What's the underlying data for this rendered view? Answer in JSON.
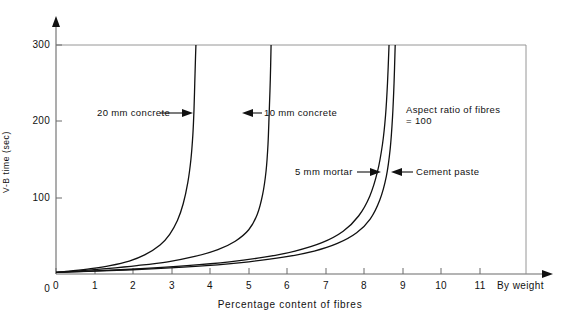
{
  "chart_data": {
    "type": "line",
    "title": "",
    "xlabel": "Percentage content of fibres",
    "ylabel": "V-B time (sec)",
    "xlim": [
      0,
      11.6
    ],
    "ylim": [
      0,
      320
    ],
    "x_ticks": [
      0,
      1,
      2,
      3,
      4,
      5,
      6,
      7,
      8,
      9,
      10,
      11
    ],
    "x_tick_labels": [
      "0",
      "1",
      "2",
      "3",
      "4",
      "5",
      "6",
      "7",
      "8",
      "9",
      "10",
      "11"
    ],
    "x_axis_end_label": "By weight",
    "y_ticks": [
      0,
      100,
      200,
      300
    ],
    "y_tick_labels": [
      "0",
      "100",
      "200",
      "300"
    ],
    "grid": false,
    "gridline_at_300": true,
    "legend_position": "inline-annotations",
    "series": [
      {
        "name": "20 mm concrete",
        "asymptote_x": 3.6,
        "points": [
          [
            0.0,
            2
          ],
          [
            0.4,
            4
          ],
          [
            0.9,
            7
          ],
          [
            1.4,
            11
          ],
          [
            1.9,
            17
          ],
          [
            2.3,
            25
          ],
          [
            2.7,
            38
          ],
          [
            2.95,
            52
          ],
          [
            3.15,
            70
          ],
          [
            3.3,
            92
          ],
          [
            3.42,
            120
          ],
          [
            3.5,
            150
          ],
          [
            3.55,
            182
          ],
          [
            3.58,
            215
          ],
          [
            3.6,
            250
          ],
          [
            3.62,
            285
          ],
          [
            3.63,
            300
          ]
        ]
      },
      {
        "name": "10 mm concrete",
        "asymptote_x": 5.55,
        "points": [
          [
            0.0,
            2
          ],
          [
            0.6,
            4
          ],
          [
            1.3,
            7
          ],
          [
            2.1,
            11
          ],
          [
            2.9,
            16
          ],
          [
            3.6,
            23
          ],
          [
            4.2,
            32
          ],
          [
            4.65,
            43
          ],
          [
            5.0,
            58
          ],
          [
            5.22,
            78
          ],
          [
            5.36,
            104
          ],
          [
            5.45,
            135
          ],
          [
            5.5,
            170
          ],
          [
            5.53,
            210
          ],
          [
            5.56,
            255
          ],
          [
            5.58,
            300
          ]
        ]
      },
      {
        "name": "5 mm mortar",
        "asymptote_x": 8.65,
        "points": [
          [
            0.0,
            2
          ],
          [
            1.0,
            4
          ],
          [
            2.2,
            7
          ],
          [
            3.4,
            11
          ],
          [
            4.5,
            16
          ],
          [
            5.4,
            22
          ],
          [
            6.2,
            30
          ],
          [
            6.9,
            41
          ],
          [
            7.45,
            56
          ],
          [
            7.85,
            76
          ],
          [
            8.14,
            102
          ],
          [
            8.34,
            134
          ],
          [
            8.47,
            170
          ],
          [
            8.55,
            208
          ],
          [
            8.6,
            250
          ],
          [
            8.64,
            300
          ]
        ]
      },
      {
        "name": "Cement paste",
        "asymptote_x": 8.77,
        "points": [
          [
            0.0,
            2
          ],
          [
            1.2,
            4
          ],
          [
            2.6,
            7
          ],
          [
            3.9,
            11
          ],
          [
            5.0,
            16
          ],
          [
            5.9,
            22
          ],
          [
            6.7,
            30
          ],
          [
            7.3,
            40
          ],
          [
            7.8,
            54
          ],
          [
            8.15,
            72
          ],
          [
            8.4,
            97
          ],
          [
            8.57,
            128
          ],
          [
            8.67,
            164
          ],
          [
            8.73,
            205
          ],
          [
            8.77,
            250
          ],
          [
            8.8,
            300
          ]
        ]
      }
    ],
    "annotations": [
      {
        "id": "ann-20mm",
        "text": "20 mm concrete",
        "arrow": "right",
        "value_y": 205
      },
      {
        "id": "ann-10mm",
        "text": "10 mm concrete",
        "arrow": "left",
        "value_y": 205
      },
      {
        "id": "ann-aspect",
        "text": "Aspect ratio of fibres\n= 100",
        "arrow": "none",
        "value_y": 200
      },
      {
        "id": "ann-5mm",
        "text": "5 mm mortar",
        "arrow": "right",
        "value_y": 133
      },
      {
        "id": "ann-cement",
        "text": "Cement paste",
        "arrow": "left",
        "value_y": 133
      }
    ]
  },
  "axes": {
    "y_title": "V-B time (sec)",
    "x_title": "Percentage content of fibres",
    "x_end_label": "By weight"
  },
  "ticks": {
    "x": [
      "0",
      "1",
      "2",
      "3",
      "4",
      "5",
      "6",
      "7",
      "8",
      "9",
      "10",
      "11"
    ],
    "y": [
      "300",
      "200",
      "100",
      "0"
    ]
  },
  "labels": {
    "concrete20": "20 mm concrete",
    "concrete10": "10 mm concrete",
    "aspect_line1": "Aspect ratio of fibres",
    "aspect_line2": "= 100",
    "mortar5": "5 mm mortar",
    "cement": "Cement paste"
  },
  "colors": {
    "ink": "#111111",
    "axis": "#6a6a6a",
    "curve": "#111111",
    "background": "#ffffff"
  }
}
